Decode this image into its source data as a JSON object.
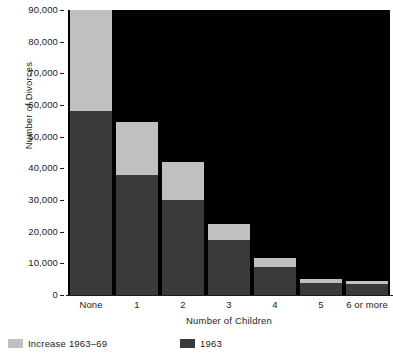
{
  "chart_data": {
    "type": "bar",
    "stacked": true,
    "title": "",
    "subtitle": "",
    "xlabel": "Number of Children",
    "ylabel": "Number of Divorces",
    "categories": [
      "None",
      "1",
      "2",
      "3",
      "4",
      "5",
      "6 or more"
    ],
    "series": [
      {
        "name": "1963",
        "color": "#3a3a3a",
        "values": [
          58000,
          38000,
          30000,
          17500,
          8800,
          3800,
          3500
        ]
      },
      {
        "name": "Increase 1963–69",
        "color": "#c0c0c0",
        "values": [
          32000,
          16500,
          12000,
          5000,
          2900,
          1300,
          900
        ]
      }
    ],
    "totals": [
      90000,
      54500,
      42000,
      22500,
      11700,
      5100,
      4400
    ],
    "ylim": [
      0,
      90000
    ],
    "yticks": [
      0,
      10000,
      20000,
      30000,
      40000,
      50000,
      60000,
      70000,
      80000,
      90000
    ],
    "ytick_labels": [
      "0",
      "10,000",
      "20,000",
      "30,000",
      "40,000",
      "50,000",
      "60,000",
      "70,000",
      "80,000",
      "90,000"
    ],
    "grid": false,
    "legend_position": "bottom-left",
    "plot_background": "#000000",
    "figure_background": "#ffffff"
  },
  "axes": {
    "y_title": "Number of Divorces",
    "x_title": "Number of Children"
  },
  "legend": {
    "entries": [
      {
        "label": "Increase 1963–69",
        "color": "#c0c0c0"
      },
      {
        "label": "1963",
        "color": "#3a3a3a"
      }
    ]
  },
  "colors": {
    "increase": "#c0c0c0",
    "base": "#3a3a3a",
    "plot_bg": "#000000",
    "text": "#1c1c1c"
  }
}
